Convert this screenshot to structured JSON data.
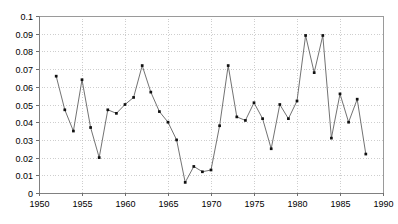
{
  "chart_data": {
    "type": "line",
    "title": "",
    "subtitle": "",
    "xlabel": "",
    "ylabel": "",
    "xlim": [
      1950,
      1990
    ],
    "ylim": [
      0,
      0.1
    ],
    "grid": true,
    "legend": null,
    "legend_position": "none",
    "marker": "filled-square",
    "x_tick_labels": [
      "1950",
      "1955",
      "1960",
      "1965",
      "1970",
      "1975",
      "1980",
      "1985",
      "1990"
    ],
    "x_ticks": [
      1950,
      1955,
      1960,
      1965,
      1970,
      1975,
      1980,
      1985,
      1990
    ],
    "y_tick_labels": [
      "0",
      "0.01",
      "0.02",
      "0.03",
      "0.04",
      "0.05",
      "0.06",
      "0.07",
      "0.08",
      "0.09",
      "0.1"
    ],
    "y_ticks": [
      0,
      0.01,
      0.02,
      0.03,
      0.04,
      0.05,
      0.06,
      0.07,
      0.08,
      0.09,
      0.1
    ],
    "x": [
      1952,
      1953,
      1954,
      1955,
      1956,
      1957,
      1958,
      1959,
      1960,
      1961,
      1962,
      1963,
      1964,
      1965,
      1966,
      1967,
      1968,
      1969,
      1970,
      1971,
      1972,
      1973,
      1974,
      1975,
      1976,
      1977,
      1978,
      1979,
      1980,
      1981,
      1982,
      1983,
      1984,
      1985,
      1986,
      1987,
      1988
    ],
    "values": [
      0.066,
      0.047,
      0.035,
      0.064,
      0.037,
      0.02,
      0.047,
      0.045,
      0.05,
      0.054,
      0.072,
      0.057,
      0.046,
      0.04,
      0.03,
      0.006,
      0.015,
      0.012,
      0.013,
      0.038,
      0.072,
      0.043,
      0.041,
      0.051,
      0.042,
      0.025,
      0.05,
      0.042,
      0.052,
      0.089,
      0.068,
      0.089,
      0.031,
      0.056,
      0.04,
      0.053,
      0.022
    ],
    "series": [
      {
        "name": "series-1",
        "color": "#595959",
        "values": [
          0.066,
          0.047,
          0.035,
          0.064,
          0.037,
          0.02,
          0.047,
          0.045,
          0.05,
          0.054,
          0.072,
          0.057,
          0.046,
          0.04,
          0.03,
          0.006,
          0.015,
          0.012,
          0.013,
          0.038,
          0.072,
          0.043,
          0.041,
          0.051,
          0.042,
          0.025,
          0.05,
          0.042,
          0.052,
          0.089,
          0.068,
          0.089,
          0.031,
          0.056,
          0.04,
          0.053,
          0.022
        ]
      }
    ],
    "annotations": []
  },
  "geometry": {
    "plot_left": 39,
    "plot_right": 383,
    "plot_top": 16,
    "plot_bottom": 193,
    "x_min": 1950,
    "x_max": 1990,
    "y_min": 0,
    "y_max": 0.1
  }
}
